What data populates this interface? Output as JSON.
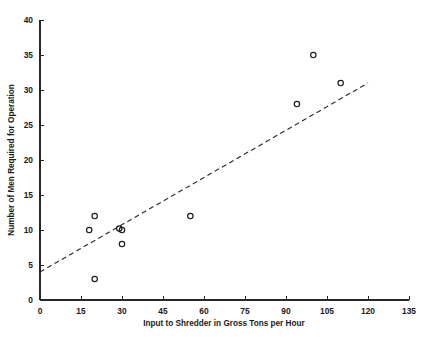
{
  "chart_data": {
    "type": "scatter",
    "title": "",
    "xlabel": "Input to Shredder in Gross Tons per Hour",
    "ylabel": "Number of Men Required for Operation",
    "xlim": [
      0,
      135
    ],
    "ylim": [
      0,
      40
    ],
    "xticks": [
      0,
      15,
      30,
      45,
      60,
      75,
      90,
      105,
      120,
      135
    ],
    "yticks": [
      0,
      5,
      10,
      15,
      20,
      25,
      30,
      35,
      40
    ],
    "xtick_labels": [
      "0",
      "15",
      "30",
      "45",
      "60",
      "75",
      "90",
      "105",
      "120",
      "135"
    ],
    "ytick_labels": [
      "0",
      "5",
      "10",
      "15",
      "20",
      "25",
      "30",
      "35",
      "40"
    ],
    "grid": false,
    "legend": "none",
    "marker_style": "open-circle",
    "points": [
      {
        "x": 18,
        "y": 10
      },
      {
        "x": 20,
        "y": 12
      },
      {
        "x": 20,
        "y": 3
      },
      {
        "x": 29,
        "y": 10.2
      },
      {
        "x": 30,
        "y": 10
      },
      {
        "x": 30,
        "y": 8
      },
      {
        "x": 55,
        "y": 12
      },
      {
        "x": 94,
        "y": 28
      },
      {
        "x": 100,
        "y": 35
      },
      {
        "x": 110,
        "y": 31
      }
    ],
    "trend_line": {
      "style": "dashed",
      "x_start": 0,
      "y_start": 4,
      "x_end": 120,
      "y_end": 31
    }
  },
  "axes": {
    "x_title": "Input to Shredder in Gross Tons per Hour",
    "y_title": "Number of Men Required for Operation"
  }
}
